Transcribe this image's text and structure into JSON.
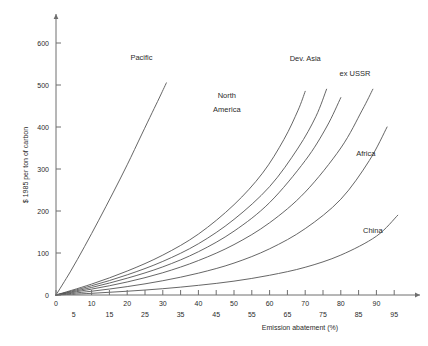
{
  "chart_data": {
    "type": "line",
    "title": "",
    "xlabel": "Emission abatement (%)",
    "ylabel": "$ 1985 per ton of carbon",
    "xlim": [
      0,
      100
    ],
    "ylim": [
      0,
      650
    ],
    "grid": false,
    "legend_position": "inline-curve-labels",
    "x_ticks_major": [
      0,
      10,
      20,
      30,
      40,
      50,
      60,
      70,
      80,
      90
    ],
    "x_ticks_minor": [
      5,
      15,
      25,
      35,
      45,
      55,
      65,
      75,
      85,
      95
    ],
    "y_ticks": [
      0,
      100,
      200,
      300,
      400,
      500,
      600
    ],
    "series": [
      {
        "name": "Pacific",
        "label": "Pacific",
        "label_x": 24,
        "label_y": 560,
        "x": [
          0,
          4,
          8,
          12,
          16,
          20,
          24,
          27,
          29,
          31
        ],
        "values": [
          0,
          55,
          115,
          178,
          243,
          310,
          381,
          434,
          469,
          505
        ]
      },
      {
        "name": "North America",
        "label": "North",
        "label2": "America",
        "label_x": 48,
        "label_y": 470,
        "label2_y": 435,
        "x": [
          0,
          10,
          20,
          30,
          40,
          50,
          58,
          64,
          68,
          70
        ],
        "values": [
          0,
          26,
          57,
          95,
          145,
          215,
          290,
          370,
          440,
          485
        ]
      },
      {
        "name": "Dev. Asia",
        "label": "Dev. Asia",
        "label_x": 70,
        "label_y": 558,
        "x": [
          0,
          10,
          20,
          30,
          40,
          50,
          60,
          68,
          73,
          76
        ],
        "values": [
          0,
          22,
          48,
          80,
          122,
          180,
          258,
          350,
          425,
          490
        ]
      },
      {
        "name": "Unlabelled",
        "label": "",
        "label_x": 0,
        "label_y": 0,
        "x": [
          0,
          10,
          20,
          30,
          40,
          50,
          60,
          70,
          76,
          80
        ],
        "values": [
          0,
          18,
          40,
          67,
          103,
          152,
          220,
          320,
          400,
          470
        ]
      },
      {
        "name": "ex USSR",
        "label": "ex USSR",
        "label_x": 84,
        "label_y": 522,
        "x": [
          0,
          10,
          20,
          30,
          40,
          50,
          60,
          70,
          80,
          86,
          89
        ],
        "values": [
          0,
          14,
          31,
          53,
          82,
          120,
          172,
          245,
          350,
          440,
          490
        ]
      },
      {
        "name": "Africa",
        "label": "Africa",
        "label_x": 87,
        "label_y": 330,
        "x": [
          0,
          10,
          20,
          30,
          40,
          50,
          60,
          70,
          80,
          88,
          93
        ],
        "values": [
          0,
          9,
          20,
          34,
          52,
          76,
          110,
          158,
          228,
          320,
          400
        ]
      },
      {
        "name": "China",
        "label": "China",
        "label_x": 89,
        "label_y": 148,
        "x": [
          0,
          10,
          20,
          30,
          40,
          50,
          60,
          70,
          80,
          90,
          96
        ],
        "values": [
          0,
          4,
          9,
          15,
          23,
          33,
          47,
          66,
          95,
          140,
          190
        ]
      }
    ]
  },
  "axes": {
    "y_label_text": "$ 1985 per ton of carbon",
    "x_label_text": "Emission abatement (%)"
  }
}
